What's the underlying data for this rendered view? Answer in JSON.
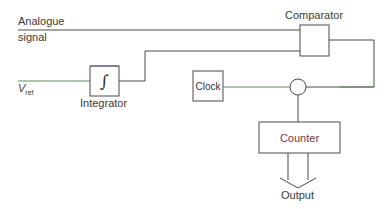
{
  "diagram": {
    "labels": {
      "analogue_line1": "Analogue",
      "analogue_line2": "signal",
      "vref_main": "V",
      "vref_sub": "ref",
      "integrator": "Integrator",
      "integrator_symbol": "∫",
      "comparator": "Comparator",
      "clock": "Clock",
      "counter": "Counter",
      "output": "Output"
    },
    "colors": {
      "line": "#4a4a4a",
      "green_tint": "#5a8a5a",
      "purple_tint": "#6a5a8a",
      "counter_text": "#7a3a4a"
    }
  }
}
